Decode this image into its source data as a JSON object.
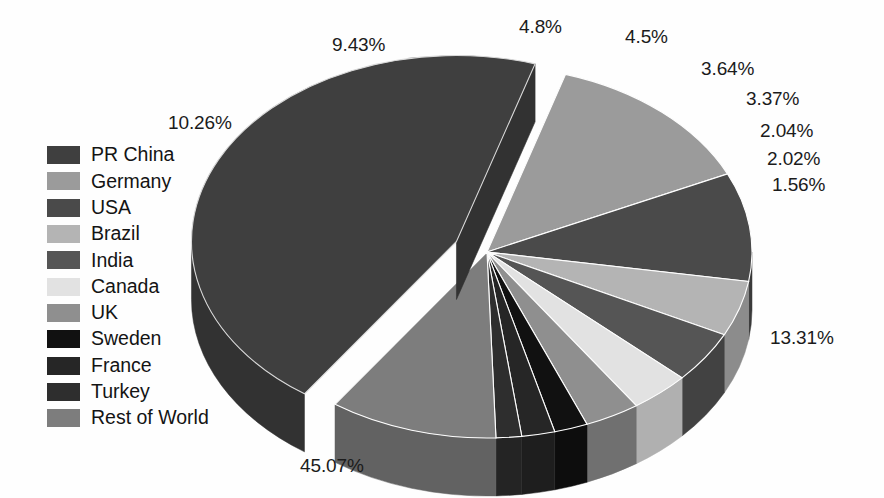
{
  "chart_data": {
    "type": "pie",
    "title": "",
    "subtitle": "",
    "xlabel": "",
    "ylabel": "",
    "legend_position": "left",
    "grid": false,
    "exploded_slice": "PR China",
    "three_d": true,
    "start_angle_deg": 125,
    "categories": [
      "PR China",
      "Germany",
      "USA",
      "Brazil",
      "India",
      "Canada",
      "UK",
      "Sweden",
      "France",
      "Turkey",
      "Rest of World"
    ],
    "values": [
      45.07,
      13.31,
      9.43,
      4.8,
      4.5,
      3.64,
      3.37,
      2.04,
      2.02,
      1.56,
      10.26
    ],
    "labels": [
      "45.07%",
      "13.31%",
      "9.43%",
      "4.8%",
      "4.5%",
      "3.64%",
      "3.37%",
      "2.04%",
      "2.02%",
      "1.56%",
      "10.26%"
    ],
    "colors": [
      "#3f3f3f",
      "#9b9b9b",
      "#4a4a4a",
      "#b4b4b4",
      "#555555",
      "#e2e2e2",
      "#8f8f8f",
      "#111111",
      "#262626",
      "#2e2e2e",
      "#7d7d7d"
    ],
    "units": "percent"
  },
  "legend": {
    "items": [
      {
        "label": "PR China",
        "color": "#3f3f3f"
      },
      {
        "label": "Germany",
        "color": "#9b9b9b"
      },
      {
        "label": "USA",
        "color": "#4a4a4a"
      },
      {
        "label": "Brazil",
        "color": "#b4b4b4"
      },
      {
        "label": "India",
        "color": "#555555"
      },
      {
        "label": "Canada",
        "color": "#e2e2e2"
      },
      {
        "label": "UK",
        "color": "#8f8f8f"
      },
      {
        "label": "Sweden",
        "color": "#111111"
      },
      {
        "label": "France",
        "color": "#262626"
      },
      {
        "label": "Turkey",
        "color": "#2e2e2e"
      },
      {
        "label": "Rest of World",
        "color": "#7d7d7d"
      }
    ]
  },
  "percent_labels": [
    {
      "name": "label-rest-of-world",
      "text": "10.26%",
      "left": 168,
      "top": 112
    },
    {
      "name": "label-usa",
      "text": "9.43%",
      "left": 332,
      "top": 34
    },
    {
      "name": "label-brazil",
      "text": "4.8%",
      "left": 519,
      "top": 16
    },
    {
      "name": "label-india",
      "text": "4.5%",
      "left": 625,
      "top": 26
    },
    {
      "name": "label-canada",
      "text": "3.64%",
      "left": 701,
      "top": 58
    },
    {
      "name": "label-uk",
      "text": "3.37%",
      "left": 746,
      "top": 88
    },
    {
      "name": "label-sweden",
      "text": "2.04%",
      "left": 760,
      "top": 120
    },
    {
      "name": "label-france",
      "text": "2.02%",
      "left": 767,
      "top": 148
    },
    {
      "name": "label-turkey",
      "text": "1.56%",
      "left": 772,
      "top": 174
    },
    {
      "name": "label-germany",
      "text": "13.31%",
      "left": 770,
      "top": 327
    },
    {
      "name": "label-pr-china",
      "text": "45.07%",
      "left": 300,
      "top": 455
    }
  ]
}
